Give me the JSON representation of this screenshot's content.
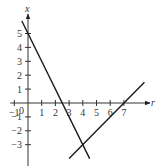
{
  "chart_data": {
    "type": "line",
    "title": "",
    "xlabel": "r",
    "ylabel": "x",
    "xlim": [
      -1.3,
      8.5
    ],
    "ylim": [
      -4,
      6
    ],
    "grid": false,
    "x_ticks": [
      -1,
      1,
      2,
      3,
      4,
      5,
      6,
      7
    ],
    "x_tick_labels": [
      "−1",
      "1",
      "2",
      "3",
      "4",
      "5",
      "6",
      "7"
    ],
    "y_ticks": [
      -3,
      -2,
      -1,
      1,
      2,
      3,
      4,
      5
    ],
    "y_tick_labels": [
      "−3",
      "−2",
      "−1",
      "1",
      "2",
      "3",
      "4",
      "5"
    ],
    "origin_label": "0",
    "series": [
      {
        "name": "x = 5 − 2r",
        "x": [
          -0.45,
          4.5
        ],
        "y": [
          5.9,
          -4.0
        ]
      },
      {
        "name": "x = r − 7",
        "x": [
          3.0,
          8.5
        ],
        "y": [
          -4.0,
          1.5
        ]
      }
    ],
    "annotations": [
      {
        "type": "intersection",
        "x": 4,
        "y": -3
      }
    ]
  }
}
